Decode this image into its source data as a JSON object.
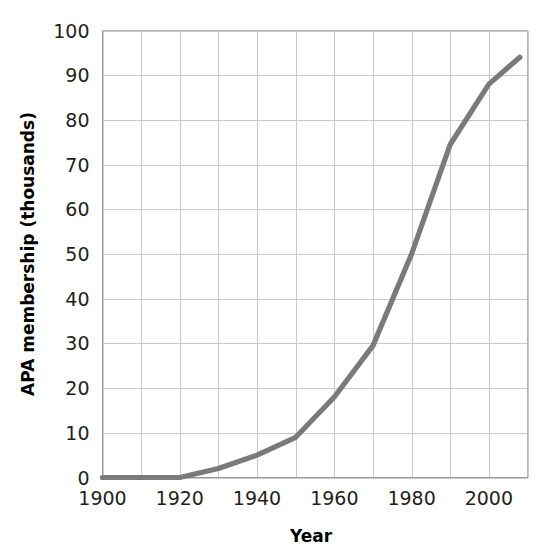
{
  "chart_data": {
    "type": "line",
    "title": "",
    "subtitle": "",
    "xlabel": "Year",
    "ylabel": "APA membership (thousands)",
    "xlim": [
      1900,
      2010
    ],
    "ylim": [
      0,
      100
    ],
    "grid": true,
    "legend": false,
    "legend_position": "none",
    "line_color": "#7a7a7a",
    "grid_color": "#c9c9c9",
    "background_color": "#ffffff",
    "text_color": "#231f20",
    "x_tick_labels": [
      "1900",
      "1920",
      "1940",
      "1960",
      "1980",
      "2000"
    ],
    "x_tick_values": [
      1900,
      1920,
      1940,
      1960,
      1980,
      2000
    ],
    "x_gridline_values": [
      1900,
      1910,
      1920,
      1930,
      1940,
      1950,
      1960,
      1970,
      1980,
      1990,
      2000,
      2010
    ],
    "y_tick_labels": [
      "0",
      "10",
      "20",
      "30",
      "40",
      "50",
      "60",
      "70",
      "80",
      "90",
      "100"
    ],
    "y_tick_values": [
      0,
      10,
      20,
      30,
      40,
      50,
      60,
      70,
      80,
      90,
      100
    ],
    "series": [
      {
        "name": "APA membership",
        "x": [
          1900,
          1920,
          1930,
          1940,
          1950,
          1960,
          1970,
          1980,
          1990,
          2000,
          2008
        ],
        "values": [
          0,
          0,
          2,
          5,
          9,
          18,
          29.5,
          50,
          74.5,
          88,
          94
        ]
      }
    ]
  }
}
